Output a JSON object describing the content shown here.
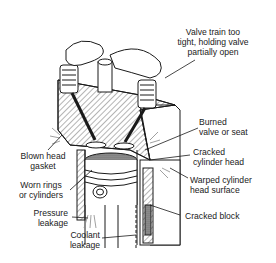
{
  "diagram": {
    "labels": {
      "valve_train": [
        "Valve train too",
        "tight, holding valve",
        "partially open"
      ],
      "burned_valve": [
        "Burned",
        "valve or seat"
      ],
      "cracked_head": [
        "Cracked",
        "cylinder head"
      ],
      "warped_head": [
        "Warped cylinder",
        "head surface"
      ],
      "cracked_block": [
        "Cracked block"
      ],
      "blown_gasket": [
        "Blown head",
        "gasket"
      ],
      "worn_rings": [
        "Worn rings",
        "or cylinders"
      ],
      "pressure_leakage": [
        "Pressure",
        "leakage"
      ],
      "coolant_leakage": [
        "Coolant",
        "leakage"
      ]
    },
    "colors": {
      "line": "#1a1a1a",
      "hatch": "#555555",
      "fill": "#ffffff",
      "piston_top": "#777777"
    }
  }
}
